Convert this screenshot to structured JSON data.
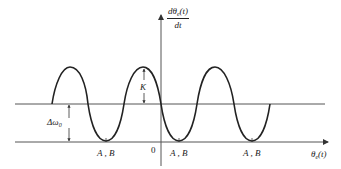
{
  "diagram": {
    "y_axis_label": {
      "numerator": "dθ",
      "numerator_sub": "e",
      "numerator_tail": "(t)",
      "denominator": "dt"
    },
    "x_axis_label": {
      "main": "θ",
      "sub": "e",
      "tail": "(t)"
    },
    "origin_label": "0",
    "amplitude_label": "K",
    "offset_label": {
      "main": "Δω",
      "sub": "0"
    },
    "equilibrium_labels": [
      "A , B",
      "A , B",
      "A , B"
    ],
    "colors": {
      "line": "#222222",
      "axis": "#555555"
    }
  }
}
